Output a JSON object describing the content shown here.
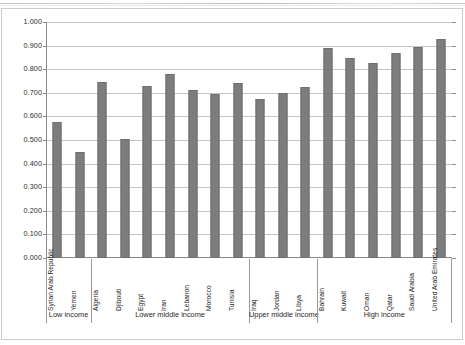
{
  "chart_data": {
    "type": "bar",
    "title": "",
    "subtitle": "",
    "xlabel": "",
    "ylabel": "",
    "ylim": [
      0.0,
      1.0
    ],
    "ytick_step": 0.1,
    "grid": true,
    "legend": "none",
    "bar_color": "#7d7d7d",
    "axis_color": "#8a8a8a",
    "gridline_color": "#c4c4c4",
    "ytick_labels": [
      "1.000",
      "0.900",
      "0.800",
      "0.700",
      "0.600",
      "0.500",
      "0.400",
      "0.300",
      "0.200",
      "0.100",
      "0.000"
    ],
    "ytick_values": [
      1.0,
      0.9,
      0.8,
      0.7,
      0.6,
      0.5,
      0.4,
      0.3,
      0.2,
      0.1,
      0.0
    ],
    "categories": [
      "Syrian Arab Republic",
      "Yemen",
      "Algeria",
      "Djibouti",
      "Egypt",
      "Iran",
      "Lebanon",
      "Morocco",
      "Tunisia",
      "Iraq",
      "Jordan",
      "Libya",
      "Bahrain",
      "Kuwait",
      "Oman",
      "Qatar",
      "Saudi Arabia",
      "United Arab Emirates"
    ],
    "values": [
      0.578,
      0.45,
      0.745,
      0.505,
      0.728,
      0.778,
      0.713,
      0.695,
      0.74,
      0.675,
      0.7,
      0.723,
      0.89,
      0.848,
      0.828,
      0.87,
      0.893,
      0.928
    ],
    "groups": [
      {
        "label": "Low income",
        "start": 0,
        "end": 1
      },
      {
        "label": "Lower middle income",
        "start": 2,
        "end": 8
      },
      {
        "label": "Upper middle income",
        "start": 9,
        "end": 11
      },
      {
        "label": "High income",
        "start": 12,
        "end": 17
      }
    ]
  }
}
